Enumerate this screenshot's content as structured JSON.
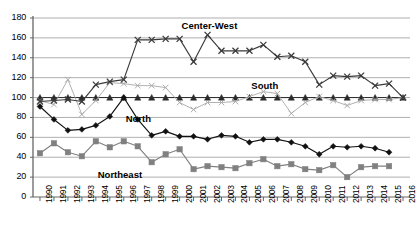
{
  "chart_data": {
    "type": "line",
    "title": "",
    "xlabel": "",
    "ylabel": "",
    "ylim": [
      0,
      180
    ],
    "ytick_step": 20,
    "yticks": [
      0,
      20,
      40,
      60,
      80,
      100,
      120,
      140,
      160,
      180
    ],
    "grid": true,
    "legend_position": "inline-annotations",
    "categories": [
      "1990",
      "1991",
      "1992",
      "1993",
      "1994",
      "1995",
      "1996",
      "1997",
      "1998",
      "1999",
      "2000",
      "2001",
      "2002",
      "2003",
      "2004",
      "2005",
      "2006",
      "2007",
      "2008",
      "2009",
      "2010",
      "2011",
      "2012",
      "2013",
      "2014",
      "2015",
      "2016"
    ],
    "series": [
      {
        "name": "Center-West",
        "marker": "x-cross",
        "color": "#3a3a3a",
        "values": [
          96,
          97,
          98,
          96,
          113,
          116,
          118,
          158,
          158,
          159,
          159,
          136,
          163,
          147,
          147,
          147,
          153,
          141,
          142,
          136,
          113,
          122,
          121,
          122,
          112,
          114,
          100
        ]
      },
      {
        "name": "South",
        "marker": "x-thin",
        "color": "#a8a8a8",
        "values": [
          97,
          93,
          118,
          83,
          97,
          115,
          114,
          112,
          112,
          110,
          95,
          88,
          95,
          95,
          96,
          101,
          106,
          104,
          84,
          95,
          101,
          97,
          92,
          97,
          98,
          98,
          100
        ]
      },
      {
        "name": "North",
        "marker": "diamond",
        "color": "#111111",
        "values": [
          91,
          78,
          67,
          68,
          72,
          81,
          100,
          78,
          62,
          66,
          61,
          61,
          58,
          62,
          61,
          55,
          58,
          58,
          55,
          51,
          43,
          51,
          50,
          51,
          49,
          45,
          null
        ]
      },
      {
        "name": "Northeast",
        "marker": "square",
        "color": "#808080",
        "values": [
          44,
          54,
          45,
          41,
          56,
          50,
          56,
          51,
          35,
          43,
          48,
          28,
          31,
          30,
          29,
          34,
          38,
          31,
          33,
          28,
          27,
          32,
          20,
          30,
          31,
          31,
          null
        ]
      },
      {
        "name": "Brazil",
        "marker": "triangle",
        "color": "#2b2b2b",
        "values": [
          100,
          100,
          100,
          100,
          100,
          100,
          100,
          100,
          100,
          100,
          100,
          100,
          100,
          100,
          100,
          100,
          100,
          100,
          100,
          100,
          100,
          100,
          100,
          100,
          100,
          100,
          100
        ]
      }
    ],
    "annotations": [
      {
        "text": "Center-West",
        "x_year": "2002",
        "y_value": 172
      },
      {
        "text": "South",
        "x_year": "2007",
        "y_value": 112
      },
      {
        "text": "North",
        "x_year": "1998",
        "y_value": 78
      },
      {
        "text": "Northeast",
        "x_year": "1996",
        "y_value": 22
      }
    ]
  }
}
